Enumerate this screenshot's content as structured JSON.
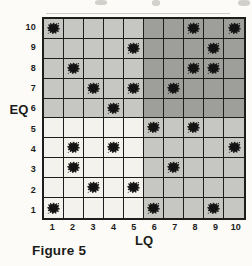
{
  "figure": {
    "caption": "Figure 5",
    "xlabel": "LQ",
    "ylabel": "EQ"
  },
  "chart_data": {
    "type": "scatter",
    "title": "",
    "xlabel": "LQ",
    "ylabel": "EQ",
    "x_ticks": [
      1,
      2,
      3,
      4,
      5,
      6,
      7,
      8,
      9,
      10
    ],
    "y_ticks": [
      1,
      2,
      3,
      4,
      5,
      6,
      7,
      8,
      9,
      10
    ],
    "xlim": [
      0.5,
      10.5
    ],
    "ylim": [
      0.5,
      10.5
    ],
    "grid": true,
    "grid_color": "#1d1d1d",
    "marker": "ink-splat",
    "marker_color": "#131313",
    "points": [
      [
        1,
        10
      ],
      [
        8,
        10
      ],
      [
        10,
        10
      ],
      [
        5,
        9
      ],
      [
        9,
        9
      ],
      [
        2,
        8
      ],
      [
        8,
        8
      ],
      [
        9,
        8
      ],
      [
        3,
        7
      ],
      [
        5,
        7
      ],
      [
        7,
        7
      ],
      [
        4,
        6
      ],
      [
        6,
        5
      ],
      [
        8,
        5
      ],
      [
        2,
        4
      ],
      [
        4,
        4
      ],
      [
        10,
        4
      ],
      [
        2,
        3
      ],
      [
        7,
        3
      ],
      [
        3,
        2
      ],
      [
        5,
        2
      ],
      [
        1,
        1
      ],
      [
        6,
        1
      ],
      [
        9,
        1
      ]
    ],
    "quadrants": [
      {
        "name": "low-LQ-low-EQ",
        "lq": [
          1,
          5
        ],
        "eq": [
          1,
          5
        ],
        "color": "#f4f2ec"
      },
      {
        "name": "low-LQ-high-EQ",
        "lq": [
          1,
          5
        ],
        "eq": [
          6,
          10
        ],
        "color": "#c6c6c2"
      },
      {
        "name": "high-LQ-low-EQ",
        "lq": [
          6,
          10
        ],
        "eq": [
          1,
          5
        ],
        "color": "#c6c6c2"
      },
      {
        "name": "high-LQ-high-EQ",
        "lq": [
          6,
          10
        ],
        "eq": [
          6,
          10
        ],
        "color": "#9e9e9a"
      }
    ]
  }
}
